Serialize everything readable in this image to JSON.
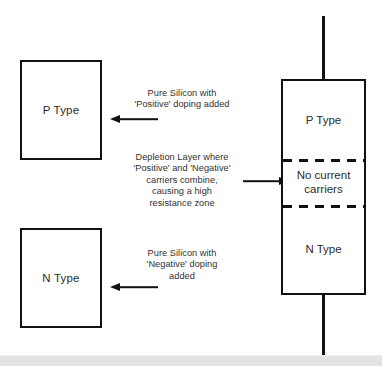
{
  "diagram": {
    "colors": {
      "line": "#111111",
      "text": "#2b2b2b",
      "background": "#ffffff",
      "page_edge": "#e3e3e3"
    }
  },
  "source_boxes": [
    {
      "id": "p-type",
      "label": "P Type"
    },
    {
      "id": "n-type",
      "label": "N Type"
    }
  ],
  "annotations": [
    {
      "id": "p-doping",
      "text": "Pure Silicon with\n'Positive' doping added",
      "arrow": "left"
    },
    {
      "id": "depletion-layer",
      "text": "Depletion Layer where\n'Positive' and 'Negative'\ncarriers combine,\ncausing  a high\nresistance zone",
      "arrow": "right"
    },
    {
      "id": "n-doping",
      "text": "Pure Silicon with\n'Negative' doping\nadded",
      "arrow": "left"
    }
  ],
  "diode": {
    "regions": [
      {
        "id": "p-region",
        "label": "P Type"
      },
      {
        "id": "depletion-region",
        "label": "No  current\ncarriers"
      },
      {
        "id": "n-region",
        "label": "N Type"
      }
    ]
  }
}
